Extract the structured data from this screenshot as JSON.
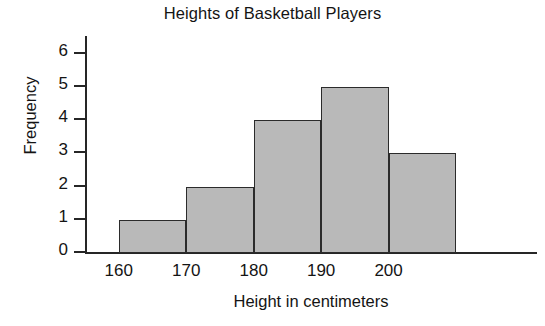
{
  "chart_data": {
    "type": "bar",
    "title": "Heights of Basketball Players",
    "xlabel": "Height in centimeters",
    "ylabel": "Frequency",
    "categories": [
      "160-170",
      "170-180",
      "180-190",
      "190-200",
      "200-210"
    ],
    "bin_edges": [
      160,
      170,
      180,
      190,
      200,
      210
    ],
    "values": [
      1,
      2,
      4,
      5,
      3
    ],
    "x_tick_labels": [
      "160",
      "170",
      "180",
      "190",
      "200"
    ],
    "x_tick_values": [
      160,
      170,
      180,
      190,
      200
    ],
    "y_tick_labels": [
      "0",
      "1",
      "2",
      "3",
      "4",
      "5",
      "6"
    ],
    "y_tick_values": [
      0,
      1,
      2,
      3,
      4,
      5,
      6
    ],
    "ylim": [
      0,
      6.5
    ],
    "xlim": [
      155,
      222
    ],
    "grid": false,
    "legend": false,
    "bar_fill_color": "#b9b9b9",
    "bar_edge_color": "#2b2b2b",
    "axis_color": "#262626",
    "background_color": "#ffffff"
  }
}
